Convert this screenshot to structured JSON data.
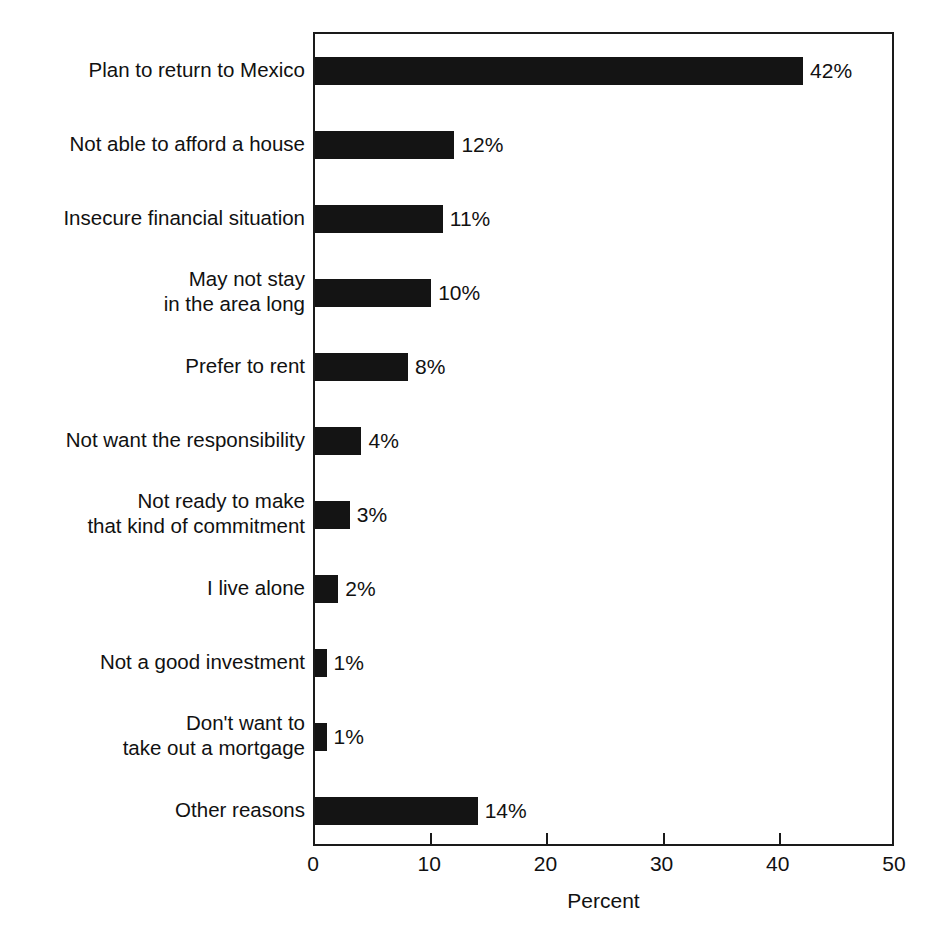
{
  "figure": {
    "caption_remnant": "",
    "plot": {
      "frame_color": "#1a1a1a",
      "bar_color": "#141414",
      "background": "#ffffff"
    }
  },
  "chart_data": {
    "type": "bar",
    "orientation": "horizontal",
    "title": "",
    "subtitle": "",
    "xlabel": "Percent",
    "ylabel": "",
    "xlim": [
      0,
      50
    ],
    "xticks": [
      0,
      10,
      20,
      30,
      40,
      50
    ],
    "xtick_labels": [
      "0",
      "10",
      "20",
      "30",
      "40",
      "50"
    ],
    "grid": false,
    "legend": null,
    "value_label_suffix": "%",
    "categories": [
      "Plan to return to Mexico",
      "Not able to afford a house",
      "Insecure financial situation",
      "May not stay\nin the area long",
      "Prefer to rent",
      "Not want the responsibility",
      "Not ready to make\nthat kind of commitment",
      "I live alone",
      "Not a good investment",
      "Don't want to\ntake out a mortgage",
      "Other reasons"
    ],
    "values": [
      42,
      12,
      11,
      10,
      8,
      4,
      3,
      2,
      1,
      1,
      14
    ],
    "value_labels": [
      "42%",
      "12%",
      "11%",
      "10%",
      "8%",
      "4%",
      "3%",
      "2%",
      "1%",
      "1%",
      "14%"
    ]
  }
}
